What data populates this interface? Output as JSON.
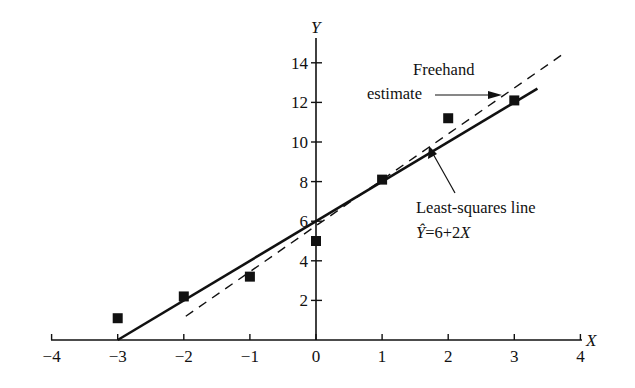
{
  "chart_data": {
    "type": "scatter",
    "title": "",
    "xlabel": "X",
    "ylabel": "Y",
    "xlim": [
      -4,
      4
    ],
    "ylim": [
      0,
      15
    ],
    "grid": false,
    "x_ticks": [
      -4,
      -3,
      -2,
      -1,
      0,
      1,
      2,
      3,
      4
    ],
    "x_tick_labels": [
      "−4",
      "−3",
      "−2",
      "−1",
      "0",
      "1",
      "2",
      "3",
      "4"
    ],
    "y_ticks": [
      2,
      4,
      6,
      8,
      10,
      12,
      14
    ],
    "y_tick_labels": [
      "2",
      "4",
      "6",
      "8",
      "10",
      "12",
      "14"
    ],
    "series": [
      {
        "name": "Observed data",
        "type": "scatter",
        "marker": "square",
        "x": [
          -3,
          -2,
          -1,
          0,
          1,
          2,
          3
        ],
        "y": [
          1.1,
          2.2,
          3.2,
          5.0,
          8.1,
          11.2,
          12.1
        ]
      },
      {
        "name": "Least-squares line",
        "type": "line",
        "style": "solid",
        "equation": "Ŷ=6+2X",
        "intercept": 6,
        "slope": 2,
        "x_range": [
          -3,
          3.35
        ]
      },
      {
        "name": "Freehand estimate",
        "type": "line",
        "style": "dashed",
        "intercept": 5.77,
        "slope": 2.32,
        "x_range": [
          -1.97,
          3.73
        ]
      }
    ],
    "annotations": [
      {
        "text_lines": [
          "Freehand",
          "estimate"
        ],
        "points_to": "Freehand estimate",
        "arrow": "horizontal"
      },
      {
        "text_lines": [
          "Least-squares line",
          "Ŷ=6+2X"
        ],
        "points_to": "Least-squares line",
        "arrow": "diagonal-up"
      }
    ]
  },
  "labels": {
    "x_axis": "X",
    "y_axis": "Y",
    "freehand_line1": "Freehand",
    "freehand_line2": "estimate",
    "ls_line1": "Least-squares line",
    "ls_eq_hat": "Ŷ",
    "ls_eq_rest": "=6+2",
    "ls_eq_x": "X"
  }
}
